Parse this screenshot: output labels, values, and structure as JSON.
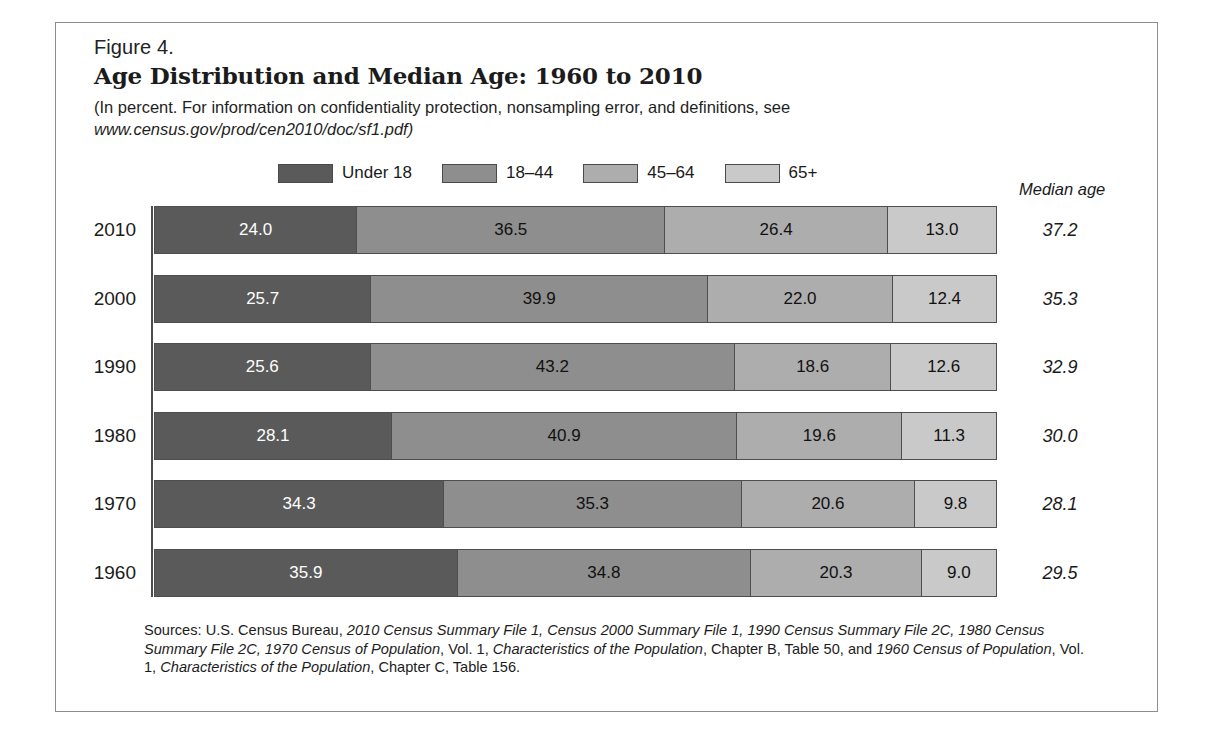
{
  "figure": {
    "label": "Figure 4.",
    "title": "Age Distribution and Median Age: 1960 to 2010",
    "subtitle_line1": "(In percent. For information on confidentiality protection, nonsampling error, and definitions, see",
    "subtitle_url": "www.census.gov/prod/cen2010/doc/sf1.pdf)",
    "median_header": "Median age"
  },
  "legend": {
    "items": [
      {
        "label": "Under 18",
        "color": "#5a5a5a"
      },
      {
        "label": "18–44",
        "color": "#8e8e8e"
      },
      {
        "label": "45–64",
        "color": "#adadad"
      },
      {
        "label": "65+",
        "color": "#c9c9c9"
      }
    ]
  },
  "chart_data": {
    "type": "bar",
    "orientation": "horizontal",
    "stacked": true,
    "normalized_percent": true,
    "title": "Age Distribution and Median Age: 1960 to 2010",
    "subtitle": "(In percent. For information on confidentiality protection, nonsampling error, and definitions, see www.census.gov/prod/cen2010/doc/sf1.pdf)",
    "xlabel": "",
    "ylabel": "",
    "xlim": [
      0,
      100
    ],
    "grid": false,
    "legend_position": "top",
    "categories": [
      "2010",
      "2000",
      "1990",
      "1980",
      "1970",
      "1960"
    ],
    "series": [
      {
        "name": "Under 18",
        "color": "#5a5a5a",
        "values": [
          24.0,
          25.7,
          25.6,
          28.1,
          34.3,
          35.9
        ]
      },
      {
        "name": "18–44",
        "color": "#8e8e8e",
        "values": [
          36.5,
          39.9,
          43.2,
          40.9,
          35.3,
          34.8
        ]
      },
      {
        "name": "45–64",
        "color": "#adadad",
        "values": [
          26.4,
          22.0,
          18.6,
          19.6,
          20.6,
          20.3
        ]
      },
      {
        "name": "65+",
        "color": "#c9c9c9",
        "values": [
          13.0,
          12.4,
          12.6,
          11.3,
          9.8,
          9.0
        ]
      }
    ],
    "annotations": {
      "median_age_label": "Median age",
      "median_age": [
        "37.2",
        "35.3",
        "32.9",
        "30.0",
        "28.1",
        "29.5"
      ]
    }
  },
  "rows": [
    {
      "year": "2010",
      "median": "37.2",
      "values": [
        "24.0",
        "36.5",
        "26.4",
        "13.0"
      ],
      "nums": [
        24.0,
        36.5,
        26.4,
        13.0
      ]
    },
    {
      "year": "2000",
      "median": "35.3",
      "values": [
        "25.7",
        "39.9",
        "22.0",
        "12.4"
      ],
      "nums": [
        25.7,
        39.9,
        22.0,
        12.4
      ]
    },
    {
      "year": "1990",
      "median": "32.9",
      "values": [
        "25.6",
        "43.2",
        "18.6",
        "12.6"
      ],
      "nums": [
        25.6,
        43.2,
        18.6,
        12.6
      ]
    },
    {
      "year": "1980",
      "median": "30.0",
      "values": [
        "28.1",
        "40.9",
        "19.6",
        "11.3"
      ],
      "nums": [
        28.1,
        40.9,
        19.6,
        11.3
      ]
    },
    {
      "year": "1970",
      "median": "28.1",
      "values": [
        "34.3",
        "35.3",
        "20.6",
        "9.8"
      ],
      "nums": [
        34.3,
        35.3,
        20.6,
        9.8
      ]
    },
    {
      "year": "1960",
      "median": "29.5",
      "values": [
        "35.9",
        "34.8",
        "20.3",
        "9.0"
      ],
      "nums": [
        35.9,
        34.8,
        20.3,
        9.0
      ]
    }
  ],
  "sources": {
    "parts": [
      {
        "text": "Sources: U.S. Census Bureau, ",
        "italic": false
      },
      {
        "text": "2010 Census Summary File 1, Census 2000 Summary File 1, 1990 Census Summary File 2C, 1980 Census Summary File 2C, 1970 Census of Population",
        "italic": true
      },
      {
        "text": ", Vol. 1, ",
        "italic": false
      },
      {
        "text": "Characteristics of the Population",
        "italic": true
      },
      {
        "text": ", Chapter B, Table 50, and ",
        "italic": false
      },
      {
        "text": "1960 Census of Population",
        "italic": true
      },
      {
        "text": ", Vol. 1, ",
        "italic": false
      },
      {
        "text": "Characteristics of the Population",
        "italic": true
      },
      {
        "text": ", Chapter C, Table 156.",
        "italic": false
      }
    ]
  }
}
